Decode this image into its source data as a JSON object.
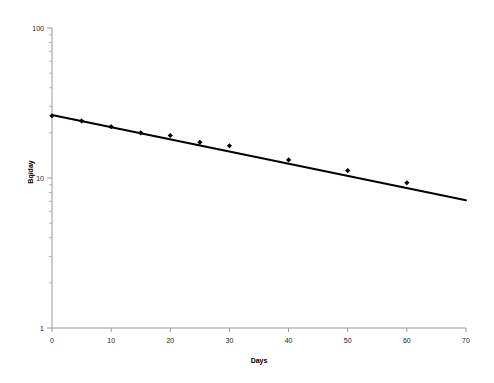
{
  "chart_data": {
    "type": "scatter",
    "title": "",
    "subtitle": "",
    "xlabel": "Days",
    "ylabel": "Bq/day",
    "xlim": [
      0,
      70
    ],
    "ylim": [
      1,
      100
    ],
    "yscale": "log",
    "xscale": "linear",
    "grid": false,
    "legend": "none",
    "x_ticks": [
      0,
      10,
      20,
      30,
      40,
      50,
      60,
      70
    ],
    "x_tick_labels": [
      "0",
      "10",
      "20",
      "30",
      "40",
      "50",
      "60",
      "70"
    ],
    "y_ticks": [
      1,
      10,
      100
    ],
    "y_tick_labels": [
      "1",
      "10",
      "100"
    ],
    "y_minor_ticks": [
      2,
      3,
      4,
      5,
      6,
      7,
      8,
      9,
      20,
      30,
      40,
      50,
      60,
      70,
      80,
      90
    ],
    "series": [
      {
        "name": "measured",
        "type": "scatter",
        "marker": "diamond",
        "color": "#000000",
        "x": [
          0,
          5,
          10,
          15,
          20,
          25,
          30,
          40,
          50,
          60
        ],
        "y": [
          26.0,
          24.0,
          22.0,
          20.0,
          19.2,
          17.3,
          16.4,
          13.2,
          11.2,
          9.3
        ]
      },
      {
        "name": "fit",
        "type": "line",
        "color": "#000000",
        "x": [
          0,
          70
        ],
        "y": [
          26.3,
          7.1
        ]
      }
    ]
  },
  "axes": {
    "x_title": "Days",
    "y_title": "Bq/day"
  }
}
